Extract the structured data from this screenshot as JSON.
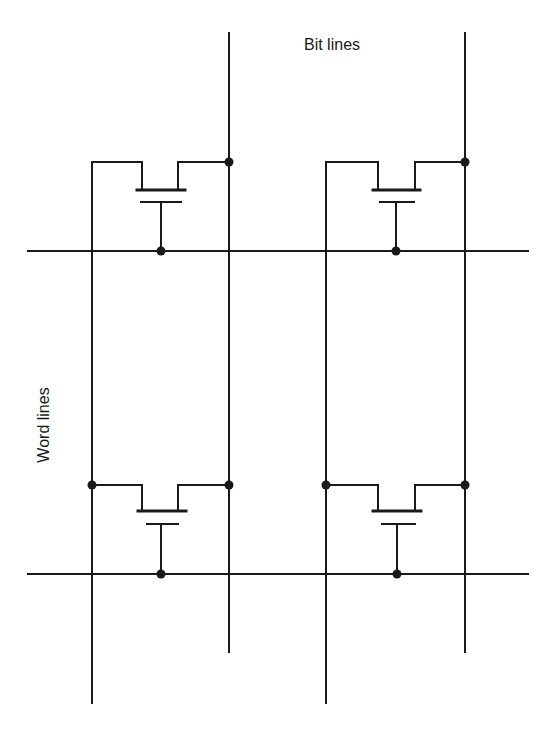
{
  "diagram": {
    "type": "memory-cell-array",
    "labels": {
      "bit_lines": "Bit lines",
      "word_lines": "Word lines"
    },
    "colors": {
      "line": "#1a1a1a",
      "background": "#ffffff"
    },
    "bit_lines": [
      {
        "id": "bit-line-1",
        "x": 229
      },
      {
        "id": "bit-line-2",
        "x": 465
      }
    ],
    "word_lines": [
      {
        "id": "word-line-1",
        "y": 251
      },
      {
        "id": "word-line-2",
        "y": 574
      }
    ],
    "cells": [
      {
        "id": "cell-r1-c1",
        "row": 1,
        "col": 1
      },
      {
        "id": "cell-r1-c2",
        "row": 1,
        "col": 2
      },
      {
        "id": "cell-r2-c1",
        "row": 2,
        "col": 1
      },
      {
        "id": "cell-r2-c2",
        "row": 2,
        "col": 2
      }
    ]
  }
}
